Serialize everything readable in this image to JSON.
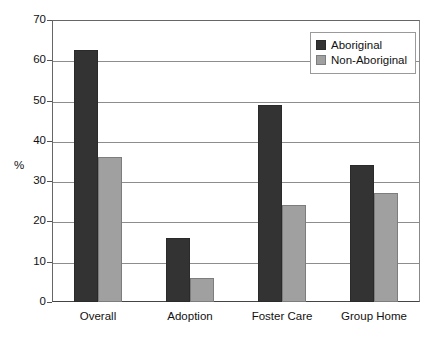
{
  "chart_data": {
    "type": "bar",
    "title": "",
    "subtitle": "",
    "xlabel": "",
    "ylabel": "%",
    "ylim": [
      0,
      70
    ],
    "ytick_step": 10,
    "yticks": [
      0,
      10,
      20,
      30,
      40,
      50,
      60,
      70
    ],
    "ytick_labels": [
      "0",
      "10",
      "20",
      "30",
      "40",
      "50",
      "60",
      "70"
    ],
    "grid": true,
    "grid_axis": "y",
    "legend_position": "top-right",
    "categories": [
      "Overall",
      "Adoption",
      "Foster Care",
      "Group Home"
    ],
    "series": [
      {
        "name": "Aboriginal",
        "color": "#333333",
        "values": [
          62.5,
          16,
          49,
          34
        ]
      },
      {
        "name": "Non-Aboriginal",
        "color": "#a0a0a0",
        "values": [
          36,
          6,
          24,
          27
        ]
      }
    ]
  },
  "legend": {
    "items": [
      {
        "label": "Aboriginal"
      },
      {
        "label": "Non-Aboriginal"
      }
    ]
  }
}
